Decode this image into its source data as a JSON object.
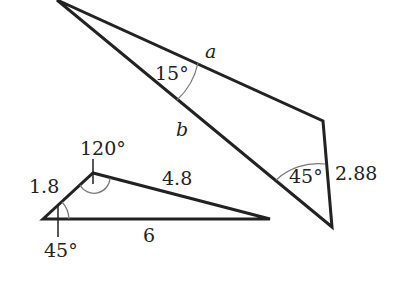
{
  "diagram": {
    "large_triangle": {
      "side_a_label": "a",
      "side_b_label": "b",
      "side_c_label": "2.88",
      "angle_top": "15°",
      "angle_bottom": "45°"
    },
    "small_triangle": {
      "side_left_label": "1.8",
      "side_top_label": "4.8",
      "side_bottom_label": "6",
      "angle_top": "120°",
      "angle_left": "45°"
    },
    "colors": {
      "line": "#222222",
      "arc": "#777777",
      "background": "#ffffff"
    }
  }
}
